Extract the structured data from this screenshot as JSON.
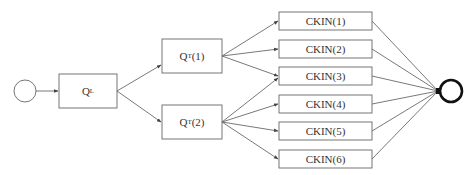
{
  "diagram": {
    "type": "flow",
    "colors": {
      "stroke": "#555555",
      "end_stroke": "#111111",
      "text": "#333333",
      "background": "#ffffff"
    },
    "start": {
      "id": "start",
      "shape": "circle"
    },
    "end": {
      "id": "end",
      "shape": "circle-bold"
    },
    "nodes": {
      "ql": {
        "main": "Q",
        "sub": "L"
      },
      "qt1": {
        "main": "Q",
        "sub": "T",
        "suffix": "(1)"
      },
      "qt2": {
        "main": "Q",
        "sub": "T",
        "suffix": "(2)"
      },
      "ckin1": {
        "label": "CKIN(1)"
      },
      "ckin2": {
        "label": "CKIN(2)"
      },
      "ckin3": {
        "label": "CKIN(3)"
      },
      "ckin4": {
        "label": "CKIN(4)"
      },
      "ckin5": {
        "label": "CKIN(5)"
      },
      "ckin6": {
        "label": "CKIN(6)"
      }
    },
    "edges": [
      [
        "start",
        "ql"
      ],
      [
        "ql",
        "qt1"
      ],
      [
        "ql",
        "qt2"
      ],
      [
        "qt1",
        "ckin1"
      ],
      [
        "qt1",
        "ckin2"
      ],
      [
        "qt1",
        "ckin3"
      ],
      [
        "qt2",
        "ckin3"
      ],
      [
        "qt2",
        "ckin4"
      ],
      [
        "qt2",
        "ckin5"
      ],
      [
        "qt2",
        "ckin6"
      ],
      [
        "ckin1",
        "end"
      ],
      [
        "ckin2",
        "end"
      ],
      [
        "ckin3",
        "end"
      ],
      [
        "ckin4",
        "end"
      ],
      [
        "ckin5",
        "end"
      ],
      [
        "ckin6",
        "end"
      ]
    ]
  }
}
